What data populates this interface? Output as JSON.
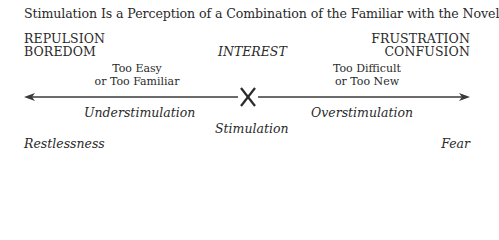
{
  "title": "Stimulation Is a Perception of a Combination of the Familiar with the Novel",
  "left_pole": {
    "line1": "REPULSION",
    "line2": "BOREDOM",
    "cause_line1": "Too Easy",
    "cause_line2": "or Too Familiar",
    "zone": "Understimulation",
    "outcome": "Restlessness"
  },
  "center": {
    "state": "INTEREST",
    "marker": "X",
    "zone": "Stimulation"
  },
  "right_pole": {
    "line1": "FRUSTRATION",
    "line2": "CONFUSION",
    "cause_line1": "Too Difficult",
    "cause_line2": "or Too New",
    "zone": "Overstimulation",
    "outcome": "Fear"
  },
  "colors": {
    "text": "#2a2a2a",
    "line": "#3a3a3a",
    "background": "#ffffff"
  }
}
